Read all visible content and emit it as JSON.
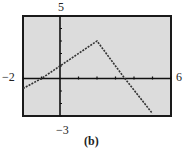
{
  "chart_data": {
    "type": "line",
    "title": "",
    "caption": "(b)",
    "xlabel": "",
    "ylabel": "",
    "xlim": [
      -2,
      6
    ],
    "ylim": [
      -3,
      5
    ],
    "xscl": 1,
    "yscl": 1,
    "grid": false,
    "style": "graphing-calculator window, dotted plot",
    "window_labels": {
      "xmin": "−2",
      "xmax": "6",
      "ymin": "−3",
      "ymax": "5"
    },
    "series": [
      {
        "name": "piecewise linear",
        "x": [
          -2,
          -1,
          0,
          2,
          3.5,
          5
        ],
        "y": [
          -0.8,
          0,
          1,
          3,
          0,
          -2.8
        ]
      }
    ],
    "pieces": [
      {
        "formula": "y = x + 1",
        "domain": [
          -2,
          2
        ]
      },
      {
        "formula": "y = -2x + 7",
        "domain": [
          2,
          5
        ]
      }
    ],
    "colors": {
      "background": "#dcdcdc",
      "frame": "#1a1a1a",
      "line": "#333333",
      "axes": "#111111"
    }
  }
}
